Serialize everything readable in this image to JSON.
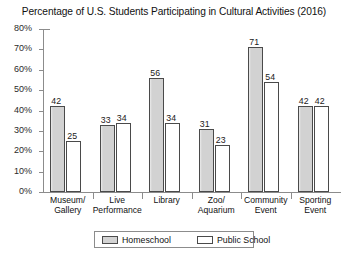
{
  "chart_data": {
    "type": "bar",
    "title": "Percentage of U.S. Students Participating in Cultural Activities (2016)",
    "xlabel": "",
    "ylabel": "",
    "categories": [
      "Museum/ Gallery",
      "Live Performance",
      "Library",
      "Zoo/ Aquarium",
      "Community Event",
      "Sporting Event"
    ],
    "category_lines": [
      [
        "Museum/",
        "Gallery"
      ],
      [
        "Live",
        "Performance"
      ],
      [
        "Library",
        ""
      ],
      [
        "Zoo/",
        "Aquarium"
      ],
      [
        "Community",
        "Event"
      ],
      [
        "Sporting",
        "Event"
      ]
    ],
    "series": [
      {
        "name": "Homeschool",
        "color": "#d2d2d2",
        "values": [
          42,
          33,
          56,
          31,
          71,
          42
        ]
      },
      {
        "name": "Public School",
        "color": "#ffffff",
        "values": [
          25,
          34,
          34,
          23,
          54,
          42
        ]
      }
    ],
    "ylim": [
      0,
      80
    ],
    "ytick_values": [
      0,
      10,
      20,
      30,
      40,
      50,
      60,
      70,
      80
    ],
    "ytick_labels": [
      "0%",
      "10%",
      "20%",
      "30%",
      "40%",
      "50%",
      "60%",
      "70%",
      "80%"
    ],
    "grid": false,
    "legend_position": "bottom-center"
  },
  "legend": {
    "items": [
      {
        "label": "Homeschool"
      },
      {
        "label": "Public School"
      }
    ]
  },
  "colors": {
    "homeschool_fill": "#d2d2d2",
    "public_school_fill": "#ffffff",
    "bar_outline": "#4a4a4a",
    "axis": "#8c8c8c",
    "text": "#111111"
  }
}
